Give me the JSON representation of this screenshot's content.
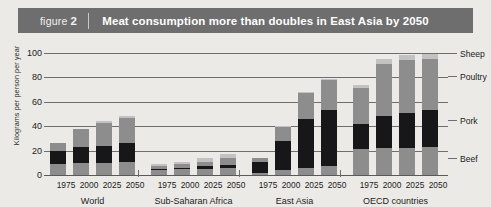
{
  "figure": {
    "label": "figure",
    "number": "2",
    "title": "Meat consumption more than doubles in East Asia by 2050"
  },
  "legend": {
    "items": [
      {
        "name": "Sheep",
        "color": "#c2c2c2",
        "value": 100
      },
      {
        "name": "Poultry",
        "color": "#8d8d8d",
        "value": 81
      },
      {
        "name": "Pork",
        "color": "#17171a",
        "value": 45
      },
      {
        "name": "Beef",
        "color": "#8d8d8d",
        "value": 14
      }
    ]
  },
  "chart_data": {
    "type": "bar",
    "title": "Meat consumption more than doubles in East Asia by 2050",
    "subtitle": "",
    "xlabel": "",
    "ylabel": "Kilograms per person per year",
    "ylim": [
      0,
      100
    ],
    "yticks": [
      0,
      20,
      40,
      60,
      80,
      100
    ],
    "grid": true,
    "stacked": true,
    "legend_position": "right",
    "annotations": [],
    "groups": [
      "World",
      "Sub-Saharan Africa",
      "East Asia",
      "OECD countries"
    ],
    "categories": [
      "1975",
      "2000",
      "2025",
      "2050"
    ],
    "series": [
      {
        "name": "Beef",
        "color": "#8d8d8d",
        "values": [
          [
            9,
            10,
            10,
            11
          ],
          [
            4,
            5,
            5,
            6
          ],
          [
            2,
            4,
            6,
            7
          ],
          [
            21,
            22,
            22,
            23
          ]
        ]
      },
      {
        "name": "Pork",
        "color": "#17171a",
        "values": [
          [
            11,
            13,
            14,
            15
          ],
          [
            1,
            1,
            2,
            2
          ],
          [
            9,
            24,
            40,
            46
          ],
          [
            21,
            26,
            29,
            30
          ]
        ]
      },
      {
        "name": "Poultry",
        "color": "#8d8d8d",
        "values": [
          [
            6,
            15,
            19,
            21
          ],
          [
            2,
            3,
            4,
            6
          ],
          [
            3,
            11,
            21,
            25
          ],
          [
            29,
            43,
            43,
            42
          ]
        ]
      },
      {
        "name": "Sheep",
        "color": "#c2c2c2",
        "values": [
          [
            0,
            0,
            1,
            1
          ],
          [
            2,
            2,
            3,
            3
          ],
          [
            0,
            1,
            1,
            1
          ],
          [
            3,
            4,
            4,
            4
          ]
        ]
      }
    ],
    "totals": [
      [
        26,
        38,
        44,
        48
      ],
      [
        9,
        11,
        14,
        17
      ],
      [
        14,
        40,
        68,
        79
      ],
      [
        74,
        95,
        98,
        99
      ]
    ]
  }
}
